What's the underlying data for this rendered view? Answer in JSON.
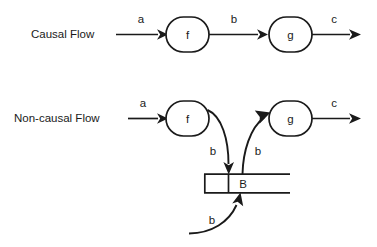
{
  "diagram": {
    "title_visible": false,
    "background_color": "#ffffff",
    "stroke_color": "#1a1a1a",
    "rows": [
      {
        "id": "causal",
        "label": "Causal Flow",
        "nodes": [
          {
            "id": "f",
            "label": "f"
          },
          {
            "id": "g",
            "label": "g"
          }
        ],
        "edges": [
          {
            "id": "a",
            "label": "a",
            "from": "input",
            "to": "f"
          },
          {
            "id": "b",
            "label": "b",
            "from": "f",
            "to": "g"
          },
          {
            "id": "c",
            "label": "c",
            "from": "g",
            "to": "output"
          }
        ]
      },
      {
        "id": "non-causal",
        "label": "Non-causal Flow",
        "nodes": [
          {
            "id": "f2",
            "label": "f"
          },
          {
            "id": "g2",
            "label": "g"
          },
          {
            "id": "buffer",
            "label": "B"
          }
        ],
        "edges": [
          {
            "id": "a2",
            "label": "a",
            "from": "input",
            "to": "f"
          },
          {
            "id": "b_down",
            "label": "b",
            "from": "f",
            "to": "B"
          },
          {
            "id": "b_up",
            "label": "b",
            "from": "B",
            "to": "g"
          },
          {
            "id": "b_in",
            "label": "b",
            "from": "external",
            "to": "B"
          },
          {
            "id": "c2",
            "label": "c",
            "from": "g",
            "to": "output"
          }
        ],
        "buffer": {
          "label": "B",
          "empty_cell_label": ""
        }
      }
    ]
  }
}
